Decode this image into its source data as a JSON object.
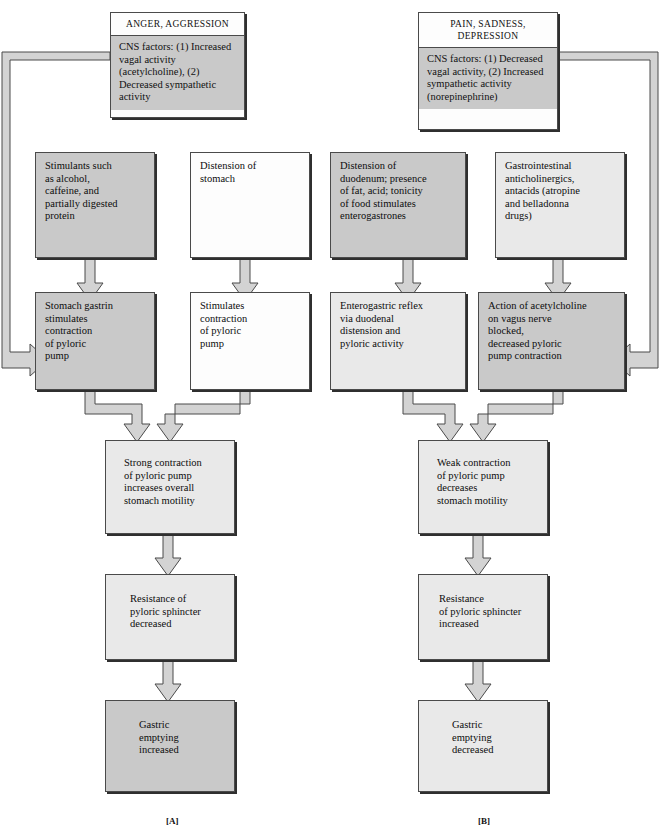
{
  "figure": {
    "background": "#ffffff",
    "box_fill_dark": "#c9c9c9",
    "box_fill_light": "#e9e9e9",
    "box_fill_white": "#fdfdfd",
    "arrow_fill": "#d0d0d0",
    "arrow_stroke": "#4a4a4a",
    "box_border": "#4a4a4a"
  },
  "panelA": {
    "label": "[A]",
    "header": {
      "title": "ANGER, AGGRESSION",
      "body_lead": "CNS factors:",
      "body_lines": [
        "(1) Increased vagal",
        "activity (acetylcholine),",
        "(2) Decreased sympathetic",
        "activity"
      ]
    },
    "boxes": [
      {
        "id": "a-stimulants",
        "shade": "dark",
        "lines": [
          "Stimulants such",
          "as alcohol,",
          "caffeine, and",
          "partially digested",
          "protein"
        ]
      },
      {
        "id": "a-distension",
        "shade": "white",
        "lines": [
          "Distension of",
          "stomach"
        ]
      },
      {
        "id": "a-gastrin",
        "shade": "dark",
        "lines": [
          "Stomach gastrin",
          "stimulates",
          "contraction",
          "of pyloric",
          "pump"
        ]
      },
      {
        "id": "a-stimulates",
        "shade": "white",
        "lines": [
          "Stimulates",
          "contraction",
          "of pyloric",
          "pump"
        ]
      },
      {
        "id": "a-strong",
        "shade": "light",
        "lines": [
          "Strong contraction",
          "of pyloric pump",
          "increases overall",
          "stomach motility"
        ]
      },
      {
        "id": "a-resistance",
        "shade": "light",
        "lines": [
          "Resistance of",
          "pyloric sphincter",
          "decreased"
        ]
      },
      {
        "id": "a-emptying",
        "shade": "dark",
        "lines": [
          "Gastric",
          "emptying",
          "increased"
        ]
      }
    ]
  },
  "panelB": {
    "label": "[B]",
    "header": {
      "title_lines": [
        "PAIN, SADNESS,",
        "DEPRESSION"
      ],
      "body_lead": "CNS factors:",
      "body_lines": [
        "(1) Decreased vagal",
        "activity,",
        "(2) Increased sympathetic",
        "activity (norepinephrine)"
      ]
    },
    "boxes": [
      {
        "id": "b-duodenum",
        "shade": "dark",
        "lines": [
          "Distension of",
          "duodenum; presence",
          "of fat, acid; tonicity",
          "of food stimulates",
          "enterogastrones"
        ]
      },
      {
        "id": "b-anticholinergics",
        "shade": "light",
        "lines": [
          "Gastrointestinal",
          "anticholinergics,",
          "antacids (atropine",
          "and belladonna",
          "drugs)"
        ]
      },
      {
        "id": "b-reflex",
        "shade": "light",
        "lines": [
          "Enterogastric reflex",
          "via duodenal",
          "distension and",
          "pyloric activity"
        ]
      },
      {
        "id": "b-acetylcholine",
        "shade": "dark",
        "lines": [
          "Action of acetylcholine",
          "on vagus nerve",
          "blocked,",
          "decreased pyloric",
          "pump contraction"
        ]
      },
      {
        "id": "b-weak",
        "shade": "light",
        "lines": [
          "Weak contraction",
          "of pyloric pump",
          "decreases",
          "stomach motility"
        ]
      },
      {
        "id": "b-resistance",
        "shade": "light",
        "lines": [
          "Resistance",
          "of pyloric sphincter",
          "increased"
        ]
      },
      {
        "id": "b-emptying",
        "shade": "light",
        "lines": [
          "Gastric",
          "emptying",
          "decreased"
        ]
      }
    ]
  }
}
